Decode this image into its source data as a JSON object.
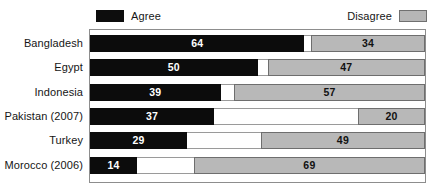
{
  "legend": {
    "agree_label": "Agree",
    "disagree_label": "Disagree",
    "agree_color": "#0c0c0c",
    "disagree_color": "#b8b8b8",
    "neutral_color": "#ffffff"
  },
  "chart_data": {
    "type": "bar",
    "subtype": "stacked-horizontal-100",
    "title": "",
    "subtitle": "",
    "xlabel": "",
    "ylabel": "",
    "xlim": [
      0,
      100
    ],
    "grid": false,
    "legend_position": "top",
    "categories": [
      "Bangladesh",
      "Egypt",
      "Indonesia",
      "Pakistan (2007)",
      "Turkey",
      "Morocco (2006)"
    ],
    "series": [
      {
        "name": "Agree",
        "color": "#0c0c0c",
        "values": [
          64,
          50,
          39,
          37,
          29,
          14
        ],
        "labels": [
          "64",
          "50",
          "39",
          "37",
          "29",
          "14"
        ]
      },
      {
        "name": "",
        "color": "#ffffff",
        "values": [
          2,
          3,
          4,
          43,
          22,
          17
        ],
        "labels": [
          "",
          "",
          "",
          "",
          "",
          ""
        ]
      },
      {
        "name": "Disagree",
        "color": "#b8b8b8",
        "values": [
          34,
          47,
          57,
          20,
          49,
          69
        ],
        "labels": [
          "34",
          "47",
          "57",
          "20",
          "49",
          "69"
        ]
      }
    ],
    "rows": [
      {
        "label": "Bangladesh",
        "agree": 64,
        "neutral": 2,
        "disagree": 34,
        "agree_label": "64",
        "disagree_label": "34"
      },
      {
        "label": "Egypt",
        "agree": 50,
        "neutral": 3,
        "disagree": 47,
        "agree_label": "50",
        "disagree_label": "47"
      },
      {
        "label": "Indonesia",
        "agree": 39,
        "neutral": 4,
        "disagree": 57,
        "agree_label": "39",
        "disagree_label": "57"
      },
      {
        "label": "Pakistan (2007)",
        "agree": 37,
        "neutral": 43,
        "disagree": 20,
        "agree_label": "37",
        "disagree_label": "20"
      },
      {
        "label": "Turkey",
        "agree": 29,
        "neutral": 22,
        "disagree": 49,
        "agree_label": "29",
        "disagree_label": "49"
      },
      {
        "label": "Morocco (2006)",
        "agree": 14,
        "neutral": 17,
        "disagree": 69,
        "agree_label": "14",
        "disagree_label": "69"
      }
    ]
  }
}
